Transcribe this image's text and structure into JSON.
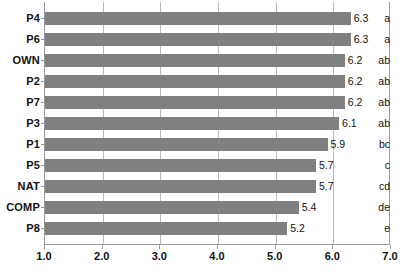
{
  "chart_data": {
    "type": "bar",
    "orientation": "horizontal",
    "title": "",
    "xlabel": "",
    "ylabel": "",
    "xlim": [
      1.0,
      7.0
    ],
    "grid": true,
    "legend": null,
    "categories": [
      "P4",
      "P6",
      "OWN",
      "P2",
      "P7",
      "P3",
      "P1",
      "P5",
      "NAT",
      "COMP",
      "P8"
    ],
    "values": [
      6.3,
      6.3,
      6.2,
      6.2,
      6.2,
      6.1,
      5.9,
      5.7,
      5.7,
      5.4,
      5.2
    ],
    "value_labels": [
      "6.3",
      "6.3",
      "6.2",
      "6.2",
      "6.2",
      "6.1",
      "5.9",
      "5.7",
      "5.7",
      "5.4",
      "5.2"
    ],
    "group_labels": [
      "a",
      "a",
      "ab",
      "ab",
      "ab",
      "ab",
      "bc",
      "c",
      "cd",
      "de",
      "e"
    ],
    "xticks": [
      1.0,
      2.0,
      3.0,
      4.0,
      5.0,
      6.0,
      7.0
    ],
    "xticklabels": [
      "1.0",
      "2.0",
      "3.0",
      "4.0",
      "5.0",
      "6.0",
      "7.0"
    ],
    "bar_color": "#808080",
    "gridline_color": "#b9b9b9",
    "axis_color": "#9a9a9a",
    "text_color": "#111111",
    "background_color": "#ffffff"
  }
}
